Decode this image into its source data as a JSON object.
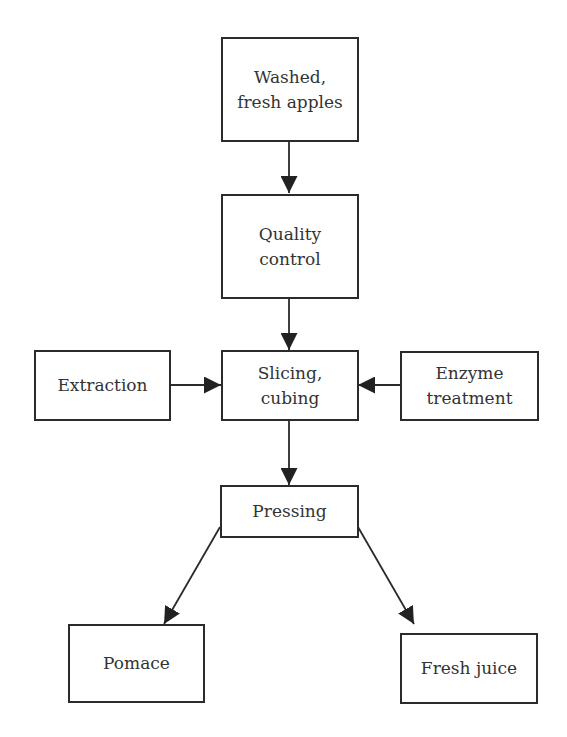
{
  "diagram": {
    "type": "flowchart",
    "nodes": [
      {
        "id": "washed_apples",
        "label": "Washed,\nfresh apples"
      },
      {
        "id": "quality_control",
        "label": "Quality\ncontrol"
      },
      {
        "id": "extraction",
        "label": "Extraction"
      },
      {
        "id": "slicing_cubing",
        "label": "Slicing,\ncubing"
      },
      {
        "id": "enzyme_treatment",
        "label": "Enzyme\ntreatment"
      },
      {
        "id": "pressing",
        "label": "Pressing"
      },
      {
        "id": "pomace",
        "label": "Pomace"
      },
      {
        "id": "fresh_juice",
        "label": "Fresh juice"
      }
    ],
    "edges": [
      {
        "from": "washed_apples",
        "to": "quality_control"
      },
      {
        "from": "quality_control",
        "to": "slicing_cubing"
      },
      {
        "from": "extraction",
        "to": "slicing_cubing"
      },
      {
        "from": "enzyme_treatment",
        "to": "slicing_cubing"
      },
      {
        "from": "slicing_cubing",
        "to": "pressing"
      },
      {
        "from": "pressing",
        "to": "pomace"
      },
      {
        "from": "pressing",
        "to": "fresh_juice"
      }
    ],
    "colors": {
      "stroke": "#2b2b2b",
      "text": "#333333",
      "background": "#ffffff"
    }
  }
}
